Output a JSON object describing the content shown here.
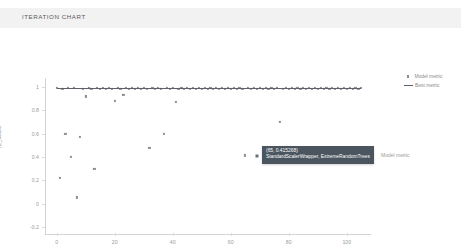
{
  "panel": {
    "title": "ITERATION CHART"
  },
  "legend": {
    "items": [
      {
        "label": "Model metric",
        "marker": "square-dot",
        "color": "#8c8c96"
      },
      {
        "label": "Best metric",
        "marker": "line",
        "color": "#5f5f68"
      }
    ]
  },
  "tooltip": {
    "coordinates": "(65, 0.415268)",
    "pipeline": "StandardScalerWrapper, ExtremeRandomTrees",
    "series_label": "Model metric",
    "background": "#4a5560"
  },
  "chart_data": {
    "type": "scatter",
    "title": "ITERATION CHART",
    "xlabel": "Iteration Number",
    "ylabel": "r2_score",
    "xlim": [
      -4,
      108
    ],
    "ylim": [
      -0.25,
      1.06
    ],
    "xticks": [
      "0",
      "20",
      "40",
      "60",
      "80",
      "100"
    ],
    "xtick_values": [
      0,
      20,
      40,
      60,
      80,
      100
    ],
    "yticks": [
      "1",
      "0.8",
      "0.6",
      "0.4",
      "0.2",
      "0",
      "-0.2"
    ],
    "ytick_values": [
      1,
      0.8,
      0.6,
      0.4,
      0.2,
      0,
      -0.2
    ],
    "grid": false,
    "legend_position": "top-right",
    "series": [
      {
        "name": "Model metric",
        "type": "scatter",
        "color": "#8c8c96",
        "points": [
          [
            0,
            0.995
          ],
          [
            1,
            0.22
          ],
          [
            2,
            0.985
          ],
          [
            3,
            0.6
          ],
          [
            4,
            0.99
          ],
          [
            5,
            0.4
          ],
          [
            6,
            0.99
          ],
          [
            7,
            0.055
          ],
          [
            8,
            0.575
          ],
          [
            9,
            0.985
          ],
          [
            10,
            0.92
          ],
          [
            11,
            0.99
          ],
          [
            12,
            0.985
          ],
          [
            13,
            0.3
          ],
          [
            14,
            0.99
          ],
          [
            15,
            0.985
          ],
          [
            16,
            0.99
          ],
          [
            17,
            0.985
          ],
          [
            18,
            0.99
          ],
          [
            19,
            0.985
          ],
          [
            20,
            0.88
          ],
          [
            21,
            0.99
          ],
          [
            22,
            0.985
          ],
          [
            23,
            0.93
          ],
          [
            24,
            0.99
          ],
          [
            25,
            0.985
          ],
          [
            26,
            0.99
          ],
          [
            27,
            0.985
          ],
          [
            28,
            0.99
          ],
          [
            29,
            0.985
          ],
          [
            30,
            0.99
          ],
          [
            31,
            0.985
          ],
          [
            32,
            0.48
          ],
          [
            33,
            0.99
          ],
          [
            34,
            0.985
          ],
          [
            35,
            0.99
          ],
          [
            36,
            0.985
          ],
          [
            37,
            0.6
          ],
          [
            38,
            0.99
          ],
          [
            39,
            0.985
          ],
          [
            40,
            0.99
          ],
          [
            41,
            0.87
          ],
          [
            42,
            0.985
          ],
          [
            43,
            0.99
          ],
          [
            44,
            0.985
          ],
          [
            45,
            0.99
          ],
          [
            46,
            0.985
          ],
          [
            47,
            0.99
          ],
          [
            48,
            0.985
          ],
          [
            49,
            0.99
          ],
          [
            50,
            0.985
          ],
          [
            51,
            0.99
          ],
          [
            52,
            0.985
          ],
          [
            53,
            0.99
          ],
          [
            54,
            0.985
          ],
          [
            55,
            0.99
          ],
          [
            56,
            0.985
          ],
          [
            57,
            0.99
          ],
          [
            58,
            0.985
          ],
          [
            59,
            0.99
          ],
          [
            60,
            0.985
          ],
          [
            61,
            0.99
          ],
          [
            62,
            0.985
          ],
          [
            63,
            0.99
          ],
          [
            64,
            0.985
          ],
          [
            65,
            0.415
          ],
          [
            66,
            0.99
          ],
          [
            67,
            0.985
          ],
          [
            68,
            0.99
          ],
          [
            69,
            0.985
          ],
          [
            70,
            0.99
          ],
          [
            71,
            0.985
          ],
          [
            72,
            0.99
          ],
          [
            73,
            0.985
          ],
          [
            74,
            0.99
          ],
          [
            75,
            0.985
          ],
          [
            76,
            0.99
          ],
          [
            77,
            0.7
          ],
          [
            78,
            0.985
          ],
          [
            79,
            0.99
          ],
          [
            80,
            0.985
          ],
          [
            81,
            0.99
          ],
          [
            82,
            0.985
          ],
          [
            83,
            0.99
          ],
          [
            84,
            0.985
          ],
          [
            85,
            0.99
          ],
          [
            86,
            0.985
          ],
          [
            87,
            0.99
          ],
          [
            88,
            0.985
          ],
          [
            89,
            0.99
          ],
          [
            90,
            0.985
          ],
          [
            91,
            0.99
          ],
          [
            92,
            0.985
          ],
          [
            93,
            0.99
          ],
          [
            94,
            0.985
          ],
          [
            95,
            0.99
          ],
          [
            96,
            0.985
          ],
          [
            97,
            0.99
          ],
          [
            98,
            0.985
          ],
          [
            99,
            0.99
          ],
          [
            100,
            0.985
          ],
          [
            101,
            0.99
          ],
          [
            102,
            0.985
          ],
          [
            103,
            0.99
          ],
          [
            104,
            0.985
          ],
          [
            105,
            0.99
          ]
        ]
      },
      {
        "name": "Best metric",
        "type": "line",
        "color": "#5f5f68",
        "points": [
          [
            0,
            0.995
          ],
          [
            105,
            0.995
          ]
        ]
      }
    ]
  }
}
